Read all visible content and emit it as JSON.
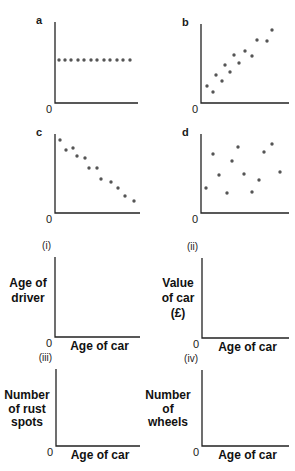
{
  "colors": {
    "axis": "#222222",
    "dot": "#555555",
    "text": "#1a1a1a",
    "background": "#ffffff"
  },
  "chart_data": [
    {
      "id": "a",
      "label": "a",
      "type": "scatter",
      "title": "",
      "xlabel": "",
      "ylabel": "",
      "origin_label": "0",
      "description": "No correlation (constant y)",
      "axis": {
        "x0": 55,
        "y0": 103,
        "xmax": 138,
        "ytop": 22
      },
      "points": [
        [
          59,
          60
        ],
        [
          65,
          60
        ],
        [
          71,
          60
        ],
        [
          78,
          60
        ],
        [
          84,
          60
        ],
        [
          91,
          60
        ],
        [
          97,
          60
        ],
        [
          104,
          60
        ],
        [
          110,
          60
        ],
        [
          117,
          60
        ],
        [
          123,
          60
        ],
        [
          130,
          60
        ]
      ]
    },
    {
      "id": "b",
      "label": "b",
      "type": "scatter",
      "title": "",
      "xlabel": "",
      "ylabel": "",
      "origin_label": "0",
      "description": "Positive correlation",
      "axis": {
        "x0": 201,
        "y0": 103,
        "xmax": 289,
        "ytop": 24
      },
      "points": [
        [
          207,
          86
        ],
        [
          213,
          92
        ],
        [
          216,
          75
        ],
        [
          222,
          81
        ],
        [
          225,
          65
        ],
        [
          230,
          72
        ],
        [
          234,
          55
        ],
        [
          239,
          63
        ],
        [
          245,
          51
        ],
        [
          252,
          56
        ],
        [
          257,
          40
        ],
        [
          267,
          41
        ],
        [
          272,
          30
        ]
      ]
    },
    {
      "id": "c",
      "label": "c",
      "type": "scatter",
      "title": "",
      "xlabel": "",
      "ylabel": "",
      "origin_label": "0",
      "description": "Negative correlation",
      "axis": {
        "x0": 55,
        "y0": 213,
        "xmax": 140,
        "ytop": 134
      },
      "points": [
        [
          60,
          140
        ],
        [
          66,
          150
        ],
        [
          73,
          148
        ],
        [
          77,
          156
        ],
        [
          85,
          158
        ],
        [
          89,
          168
        ],
        [
          97,
          168
        ],
        [
          101,
          179
        ],
        [
          111,
          182
        ],
        [
          118,
          188
        ],
        [
          125,
          196
        ],
        [
          134,
          201
        ]
      ]
    },
    {
      "id": "d",
      "label": "d",
      "type": "scatter",
      "title": "",
      "xlabel": "",
      "ylabel": "",
      "origin_label": "0",
      "description": "No correlation (random scatter)",
      "axis": {
        "x0": 201,
        "y0": 213,
        "xmax": 289,
        "ytop": 134
      },
      "points": [
        [
          206,
          188
        ],
        [
          213,
          154
        ],
        [
          219,
          175
        ],
        [
          227,
          193
        ],
        [
          232,
          161
        ],
        [
          238,
          147
        ],
        [
          244,
          174
        ],
        [
          252,
          192
        ],
        [
          259,
          180
        ],
        [
          264,
          152
        ],
        [
          272,
          144
        ],
        [
          280,
          172
        ]
      ]
    },
    {
      "id": "i",
      "label": "(i)",
      "type": "scatter",
      "title": "",
      "xlabel": "Age of car",
      "ylabel_lines": [
        "Age of",
        "driver"
      ],
      "origin_label": "0",
      "axis": {
        "x0": 55,
        "y0": 337,
        "xmax": 140,
        "ytop": 257
      },
      "ylabel_pos": {
        "x": 28,
        "y": [
          287,
          302
        ]
      },
      "points": []
    },
    {
      "id": "ii",
      "label": "(ii)",
      "type": "scatter",
      "title": "",
      "xlabel": "Age of car",
      "ylabel_lines": [
        "Value",
        "of car",
        "(£)"
      ],
      "origin_label": "0",
      "axis": {
        "x0": 202,
        "y0": 338,
        "xmax": 289,
        "ytop": 258
      },
      "ylabel_pos": {
        "x": 178,
        "y": [
          287,
          302,
          317
        ]
      },
      "points": []
    },
    {
      "id": "iii",
      "label": "(iii)",
      "type": "scatter",
      "title": "",
      "xlabel": "Age of car",
      "ylabel_lines": [
        "Number",
        "of rust",
        "spots"
      ],
      "origin_label": "0",
      "axis": {
        "x0": 56,
        "y0": 446,
        "xmax": 140,
        "ytop": 369
      },
      "ylabel_pos": {
        "x": 27,
        "y": [
          399,
          413,
          426
        ]
      },
      "points": []
    },
    {
      "id": "iv",
      "label": "(iv)",
      "type": "scatter",
      "title": "",
      "xlabel": "Age of car",
      "ylabel_lines": [
        "Number",
        "of",
        "wheels"
      ],
      "origin_label": "0",
      "axis": {
        "x0": 202,
        "y0": 446,
        "xmax": 289,
        "ytop": 370
      },
      "ylabel_pos": {
        "x": 168,
        "y": [
          399,
          413,
          426
        ]
      },
      "points": []
    }
  ]
}
